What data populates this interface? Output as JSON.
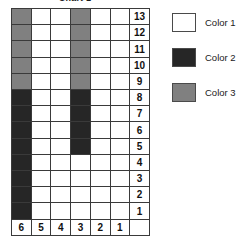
{
  "chart_title": "Chart 1",
  "legend": {
    "position": "right",
    "items": [
      {
        "label": "Color 1",
        "color": "#ffffff",
        "key": "c1"
      },
      {
        "label": "Color 2",
        "color": "#262626",
        "key": "c2"
      },
      {
        "label": "Color 3",
        "color": "#808080",
        "key": "c3"
      }
    ]
  },
  "axes": {
    "column_labels": [
      "6",
      "5",
      "4",
      "3",
      "2",
      "1"
    ],
    "row_labels": [
      "13",
      "12",
      "11",
      "10",
      "9",
      "8",
      "7",
      "6",
      "5",
      "4",
      "3",
      "2",
      "1"
    ]
  },
  "chart_data": {
    "type": "heatmap",
    "title": "Chart 1",
    "xlabel": "",
    "ylabel": "",
    "grid": true,
    "legend_position": "right",
    "categories": [
      "6",
      "5",
      "4",
      "3",
      "2",
      "1"
    ],
    "rows": [
      "13",
      "12",
      "11",
      "10",
      "9",
      "8",
      "7",
      "6",
      "5",
      "4",
      "3",
      "2",
      "1"
    ],
    "palette": {
      "c1": "#ffffff",
      "c2": "#262626",
      "c3": "#808080"
    },
    "legend_entries": [
      "Color 1",
      "Color 2",
      "Color 3"
    ],
    "cells": [
      {
        "row": "13",
        "values": [
          "c3",
          "c1",
          "c1",
          "c3",
          "c1",
          "c1"
        ]
      },
      {
        "row": "12",
        "values": [
          "c3",
          "c1",
          "c1",
          "c3",
          "c1",
          "c1"
        ]
      },
      {
        "row": "11",
        "values": [
          "c3",
          "c1",
          "c1",
          "c3",
          "c1",
          "c1"
        ]
      },
      {
        "row": "10",
        "values": [
          "c3",
          "c1",
          "c1",
          "c3",
          "c1",
          "c1"
        ]
      },
      {
        "row": "9",
        "values": [
          "c3",
          "c1",
          "c1",
          "c3",
          "c1",
          "c1"
        ]
      },
      {
        "row": "8",
        "values": [
          "c2",
          "c1",
          "c1",
          "c2",
          "c1",
          "c1"
        ]
      },
      {
        "row": "7",
        "values": [
          "c2",
          "c1",
          "c1",
          "c2",
          "c1",
          "c1"
        ]
      },
      {
        "row": "6",
        "values": [
          "c2",
          "c1",
          "c1",
          "c2",
          "c1",
          "c1"
        ]
      },
      {
        "row": "5",
        "values": [
          "c2",
          "c1",
          "c1",
          "c2",
          "c1",
          "c1"
        ]
      },
      {
        "row": "4",
        "values": [
          "c2",
          "c1",
          "c1",
          "c1",
          "c1",
          "c1"
        ]
      },
      {
        "row": "3",
        "values": [
          "c2",
          "c1",
          "c1",
          "c1",
          "c1",
          "c1"
        ]
      },
      {
        "row": "2",
        "values": [
          "c2",
          "c1",
          "c1",
          "c1",
          "c1",
          "c1"
        ]
      },
      {
        "row": "1",
        "values": [
          "c2",
          "c1",
          "c1",
          "c1",
          "c1",
          "c1"
        ]
      }
    ],
    "column_totals": {
      "6": {
        "c2": 8,
        "c3": 5,
        "c1": 0
      },
      "5": {
        "c2": 0,
        "c3": 0,
        "c1": 13
      },
      "4": {
        "c2": 0,
        "c3": 0,
        "c1": 13
      },
      "3": {
        "c2": 4,
        "c3": 5,
        "c1": 4
      },
      "2": {
        "c2": 0,
        "c3": 0,
        "c1": 13
      },
      "1": {
        "c2": 0,
        "c3": 0,
        "c1": 13
      }
    }
  }
}
